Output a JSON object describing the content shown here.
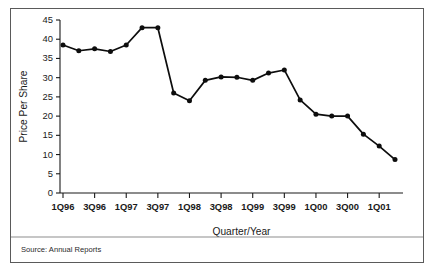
{
  "figure": {
    "source_note": "Source: Annual Reports",
    "border_color": "#5a5a5a",
    "line_color": "#0d0d0d"
  },
  "chart_data": {
    "type": "line",
    "title": "",
    "xlabel": "Quarter/Year",
    "ylabel": "Price Per Share",
    "ylim": [
      0,
      45
    ],
    "yticks": [
      0,
      5,
      10,
      15,
      20,
      25,
      30,
      35,
      40,
      45
    ],
    "ytick_labels": [
      "0",
      "5",
      "10",
      "15",
      "20",
      "25",
      "30",
      "35",
      "40",
      "45"
    ],
    "grid": false,
    "legend": "none",
    "marker": "filled-circle",
    "x": [
      "1Q96",
      "2Q96",
      "3Q96",
      "4Q96",
      "1Q97",
      "2Q97",
      "3Q97",
      "4Q97",
      "1Q98",
      "2Q98",
      "3Q98",
      "4Q98",
      "1Q99",
      "2Q99",
      "3Q99",
      "4Q99",
      "1Q00",
      "2Q00",
      "3Q00",
      "4Q00",
      "1Q01",
      "2Q01"
    ],
    "xtick_labels": [
      "1Q96",
      "3Q96",
      "1Q97",
      "3Q97",
      "1Q98",
      "3Q98",
      "1Q99",
      "3Q99",
      "1Q00",
      "3Q00",
      "1Q01"
    ],
    "xtick_indices": [
      0,
      2,
      4,
      6,
      8,
      10,
      12,
      14,
      16,
      18,
      20
    ],
    "values": [
      38.5,
      37.0,
      37.5,
      36.8,
      38.5,
      43.0,
      43.0,
      26.0,
      24.0,
      29.3,
      30.2,
      30.1,
      29.3,
      31.2,
      32.0,
      24.2,
      20.5,
      20.0,
      20.0,
      15.3,
      12.2,
      8.7
    ],
    "series": [
      {
        "name": "Price Per Share",
        "values": [
          38.5,
          37.0,
          37.5,
          36.8,
          38.5,
          43.0,
          43.0,
          26.0,
          24.0,
          29.3,
          30.2,
          30.1,
          29.3,
          31.2,
          32.0,
          24.2,
          20.5,
          20.0,
          20.0,
          15.3,
          12.2,
          8.7
        ]
      }
    ]
  }
}
